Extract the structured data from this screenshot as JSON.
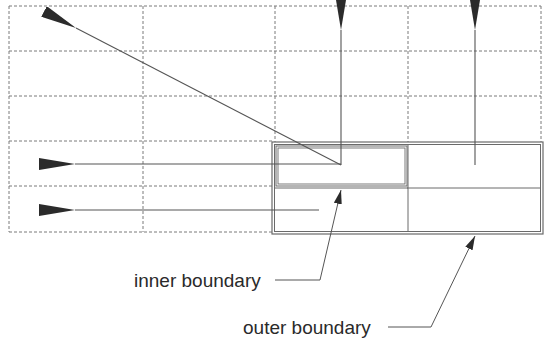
{
  "diagram": {
    "labels": {
      "inner": "inner boundary",
      "outer": "outer boundary"
    },
    "colors": {
      "grid": "#7a7a7a",
      "line": "#555555",
      "arrowhead": "#2b2b2b",
      "boundary": "#6a6a6a",
      "text": "#2a2a2a"
    },
    "grid": {
      "columns_x": [
        9,
        143,
        275,
        408,
        541
      ],
      "rows_y": [
        6,
        51,
        96,
        141,
        186,
        232
      ]
    },
    "outer_boundary": {
      "x": 272,
      "y": 142,
      "width": 271,
      "height": 92
    },
    "inner_boundary": {
      "x": 276,
      "y": 146,
      "width": 131,
      "height": 40
    },
    "vectors": [
      {
        "name": "diagonal-arrow",
        "from": [
          341,
          165
        ],
        "to": [
          76,
          28
        ]
      },
      {
        "name": "up-arrow-left-cell",
        "from": [
          341,
          165
        ],
        "to": [
          341,
          30
        ]
      },
      {
        "name": "up-arrow-right-cell",
        "from": [
          475,
          165
        ],
        "to": [
          475,
          30
        ]
      },
      {
        "name": "left-arrow-upper-row",
        "from": [
          341,
          164
        ],
        "to": [
          75,
          164
        ]
      },
      {
        "name": "left-arrow-lower-row",
        "from": [
          319,
          210
        ],
        "to": [
          75,
          210
        ]
      }
    ]
  }
}
